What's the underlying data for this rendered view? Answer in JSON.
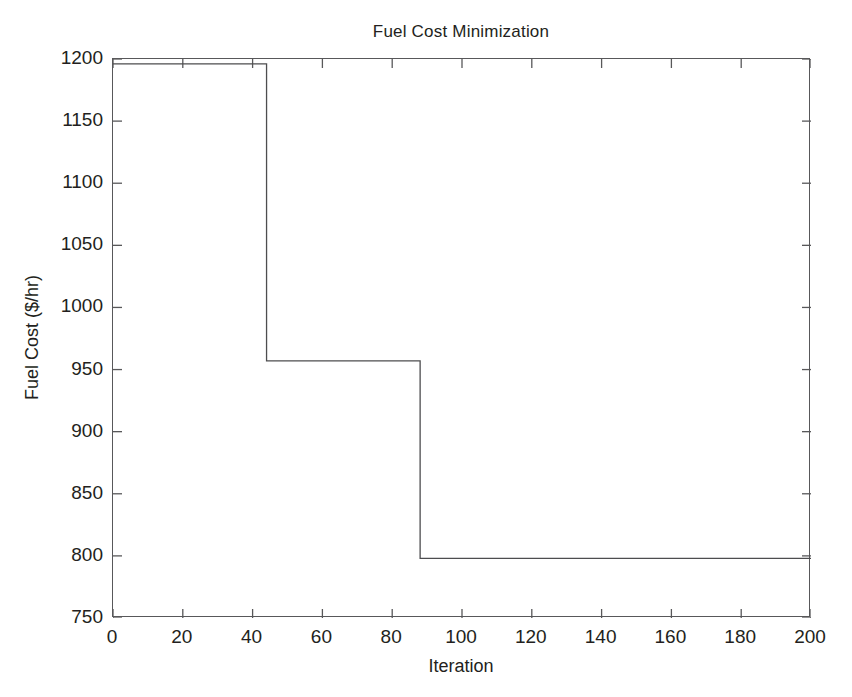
{
  "chart_data": {
    "type": "line",
    "title": "Fuel Cost Minimization",
    "xlabel": "Iteration",
    "ylabel": "Fuel Cost ($/hr)",
    "xlim": [
      0,
      200
    ],
    "ylim": [
      750,
      1200
    ],
    "xticks": [
      0,
      20,
      40,
      60,
      80,
      100,
      120,
      140,
      160,
      180,
      200
    ],
    "yticks": [
      750,
      800,
      850,
      900,
      950,
      1000,
      1050,
      1100,
      1150,
      1200
    ],
    "grid": false,
    "legend": null,
    "line_color": "#4d4d4f",
    "series": [
      {
        "name": "Best fuel cost",
        "step": true,
        "x": [
          0,
          44,
          44,
          88,
          88,
          200
        ],
        "y": [
          1196,
          1196,
          957,
          957,
          798,
          798
        ]
      }
    ],
    "annotations": [
      "Initial cost plateau 1196 $/hr held through iteration 44",
      "Step decrease to 957 $/hr at iteration 44, held through iteration 88",
      "Step decrease to 798 $/hr at iteration 88, held through iteration 200"
    ]
  },
  "axes": {
    "x_tick_labels": [
      "0",
      "20",
      "40",
      "60",
      "80",
      "100",
      "120",
      "140",
      "160",
      "180",
      "200"
    ],
    "y_tick_labels": [
      "750",
      "800",
      "850",
      "900",
      "950",
      "1000",
      "1050",
      "1100",
      "1150",
      "1200"
    ]
  }
}
